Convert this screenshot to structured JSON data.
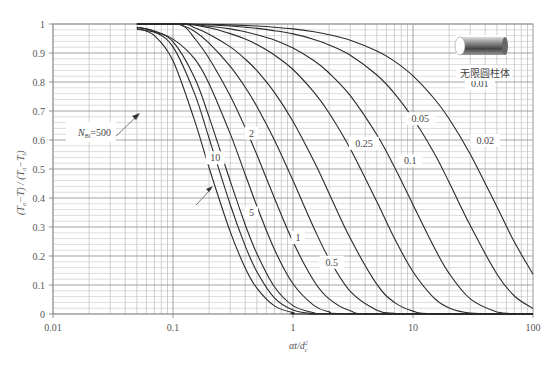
{
  "chart_data": {
    "type": "line",
    "title": "",
    "xlabel": "αt/d_c²",
    "ylabel": "(T_a−T) / (T_a−T_i)",
    "xscale": "log",
    "xlim": [
      0.01,
      100
    ],
    "ylim": [
      0,
      1
    ],
    "grid": true,
    "x_ticks": [
      {
        "value": 0.01,
        "label": "0.01"
      },
      {
        "value": 0.1,
        "label": "0.1"
      },
      {
        "value": 1,
        "label": "1"
      },
      {
        "value": 10,
        "label": "10"
      },
      {
        "value": 100,
        "label": "100"
      }
    ],
    "y_ticks": [
      {
        "value": 0,
        "label": "0"
      },
      {
        "value": 0.1,
        "label": "0.1"
      },
      {
        "value": 0.2,
        "label": "0.2"
      },
      {
        "value": 0.3,
        "label": "0.3"
      },
      {
        "value": 0.4,
        "label": "0.4"
      },
      {
        "value": 0.5,
        "label": "0.5"
      },
      {
        "value": 0.6,
        "label": "0.6"
      },
      {
        "value": 0.7,
        "label": "0.7"
      },
      {
        "value": 0.8,
        "label": "0.8"
      },
      {
        "value": 0.9,
        "label": "0.9"
      },
      {
        "value": 1,
        "label": "1"
      }
    ],
    "shape_label": "无限圆柱体",
    "parameter": "N_Bi",
    "series": [
      {
        "name": "500",
        "label": "N_Bi=500",
        "x": [
          0.05,
          0.07,
          0.1,
          0.15,
          0.2,
          0.3,
          0.4,
          0.5,
          0.7,
          1,
          1.5,
          100
        ],
        "y": [
          0.985,
          0.96,
          0.873,
          0.672,
          0.504,
          0.283,
          0.159,
          0.089,
          0.028,
          0.005,
          0,
          0
        ]
      },
      {
        "name": "10",
        "label": "10",
        "x": [
          0.05,
          0.07,
          0.1,
          0.15,
          0.2,
          0.3,
          0.4,
          0.5,
          0.7,
          1,
          1.5,
          2,
          100
        ],
        "y": [
          0.989,
          0.973,
          0.921,
          0.764,
          0.606,
          0.377,
          0.235,
          0.146,
          0.056,
          0.014,
          0.001,
          0,
          0
        ]
      },
      {
        "name": "5",
        "label": "5",
        "x": [
          0.05,
          0.07,
          0.1,
          0.15,
          0.2,
          0.3,
          0.4,
          0.5,
          0.7,
          1,
          1.5,
          2,
          100
        ],
        "y": [
          0.989,
          0.976,
          0.939,
          0.818,
          0.679,
          0.458,
          0.308,
          0.208,
          0.094,
          0.029,
          0.004,
          0.001,
          0
        ]
      },
      {
        "name": "2",
        "label": "2",
        "x": [
          0.05,
          0.07,
          0.1,
          0.15,
          0.2,
          0.3,
          0.4,
          0.5,
          0.7,
          1,
          1.5,
          2,
          3,
          100
        ],
        "y": [
          0.982,
          0.972,
          0.948,
          0.882,
          0.794,
          0.621,
          0.481,
          0.372,
          0.223,
          0.104,
          0.029,
          0.008,
          0.001,
          0
        ]
      },
      {
        "name": "1",
        "label": "1",
        "x": [
          0.05,
          0.1,
          0.125,
          0.15,
          0.2,
          0.3,
          0.4,
          0.5,
          0.7,
          1,
          1.5,
          2,
          3,
          5,
          100
        ],
        "y": [
          1,
          1,
          0.99,
          0.953,
          0.881,
          0.752,
          0.642,
          0.549,
          0.4,
          0.249,
          0.113,
          0.052,
          0.011,
          0,
          0
        ]
      },
      {
        "name": "0.5",
        "label": "0.5",
        "x": [
          0.05,
          0.1,
          0.12,
          0.15,
          0.2,
          0.3,
          0.4,
          0.5,
          0.7,
          1,
          1.5,
          2,
          3,
          5,
          7,
          10,
          100
        ],
        "y": [
          1,
          1,
          0.995,
          0.976,
          0.934,
          0.854,
          0.782,
          0.716,
          0.6,
          0.46,
          0.295,
          0.19,
          0.078,
          0.013,
          0.002,
          0,
          0
        ]
      },
      {
        "name": "0.25",
        "label": "0.25",
        "x": [
          0.05,
          0.12,
          0.15,
          0.2,
          0.3,
          0.4,
          0.5,
          0.7,
          1,
          1.5,
          2,
          3,
          5,
          7,
          10,
          15,
          100
        ],
        "y": [
          1,
          1,
          0.988,
          0.965,
          0.921,
          0.879,
          0.839,
          0.764,
          0.664,
          0.526,
          0.416,
          0.261,
          0.102,
          0.04,
          0.01,
          0.001,
          0
        ]
      },
      {
        "name": "0.1",
        "label": "0.1",
        "x": [
          0.05,
          0.125,
          0.2,
          0.3,
          0.4,
          0.5,
          0.7,
          1,
          1.5,
          2,
          3,
          5,
          7,
          10,
          15,
          20,
          30,
          50,
          100
        ],
        "y": [
          1,
          1,
          0.987,
          0.967,
          0.948,
          0.929,
          0.893,
          0.843,
          0.764,
          0.693,
          0.57,
          0.387,
          0.261,
          0.146,
          0.055,
          0.021,
          0.003,
          0,
          0
        ]
      },
      {
        "name": "0.05",
        "label": "0.05",
        "x": [
          0.05,
          0.125,
          0.2,
          0.3,
          0.4,
          0.5,
          0.7,
          1,
          1.5,
          2,
          3,
          5,
          7,
          10,
          15,
          20,
          30,
          50,
          70,
          100
        ],
        "y": [
          1,
          1,
          0.992,
          0.983,
          0.973,
          0.963,
          0.945,
          0.917,
          0.873,
          0.831,
          0.753,
          0.618,
          0.507,
          0.377,
          0.23,
          0.14,
          0.052,
          0.007,
          0.001,
          0
        ]
      },
      {
        "name": "0.02",
        "label": "0.02",
        "x": [
          0.05,
          0.125,
          0.3,
          0.5,
          0.7,
          1,
          1.5,
          2,
          3,
          5,
          7,
          10,
          15,
          20,
          30,
          50,
          70,
          100
        ],
        "y": [
          1,
          1,
          0.993,
          0.985,
          0.977,
          0.966,
          0.947,
          0.928,
          0.892,
          0.824,
          0.761,
          0.675,
          0.555,
          0.454,
          0.305,
          0.138,
          0.062,
          0.019
        ]
      },
      {
        "name": "0.01",
        "label": "0.01",
        "x": [
          0.05,
          0.125,
          0.3,
          0.5,
          0.7,
          1,
          1.5,
          2,
          3,
          5,
          7,
          10,
          15,
          20,
          30,
          50,
          70,
          100
        ],
        "y": [
          1,
          1,
          0.997,
          0.993,
          0.989,
          0.983,
          0.973,
          0.963,
          0.944,
          0.907,
          0.872,
          0.821,
          0.743,
          0.673,
          0.551,
          0.37,
          0.248,
          0.137
        ]
      }
    ],
    "annotations": [
      {
        "text": "0.01",
        "x": 36,
        "y": 0.785
      },
      {
        "text": "0.02",
        "x": 40,
        "y": 0.59
      },
      {
        "text": "0.05",
        "x": 11.5,
        "y": 0.665
      },
      {
        "text": "0.1",
        "x": 9.5,
        "y": 0.52
      },
      {
        "text": "0.25",
        "x": 3.9,
        "y": 0.58
      },
      {
        "text": "0.5",
        "x": 2.1,
        "y": 0.17
      },
      {
        "text": "1",
        "x": 1.1,
        "y": 0.255
      },
      {
        "text": "2",
        "x": 0.45,
        "y": 0.615
      },
      {
        "text": "5",
        "x": 0.45,
        "y": 0.34
      },
      {
        "text": "10",
        "x": 0.225,
        "y": 0.53
      },
      {
        "text": "N_Bi=500",
        "x": 0.034,
        "y": 0.6
      }
    ]
  },
  "labels": {
    "x_axis": "αt/d",
    "x_axis_sup": "2",
    "x_axis_sub": "c",
    "y_axis_pre": "(T",
    "y_axis_sub1": "a",
    "y_axis_mid": "−T) / (T",
    "y_axis_sub2": "a",
    "y_axis_mid2": "−T",
    "y_axis_sub3": "i",
    "y_axis_post": ")",
    "shape": "无限圆柱体",
    "nbi_prefix": "N",
    "nbi_sub": "Bi",
    "nbi_value": "=500"
  }
}
